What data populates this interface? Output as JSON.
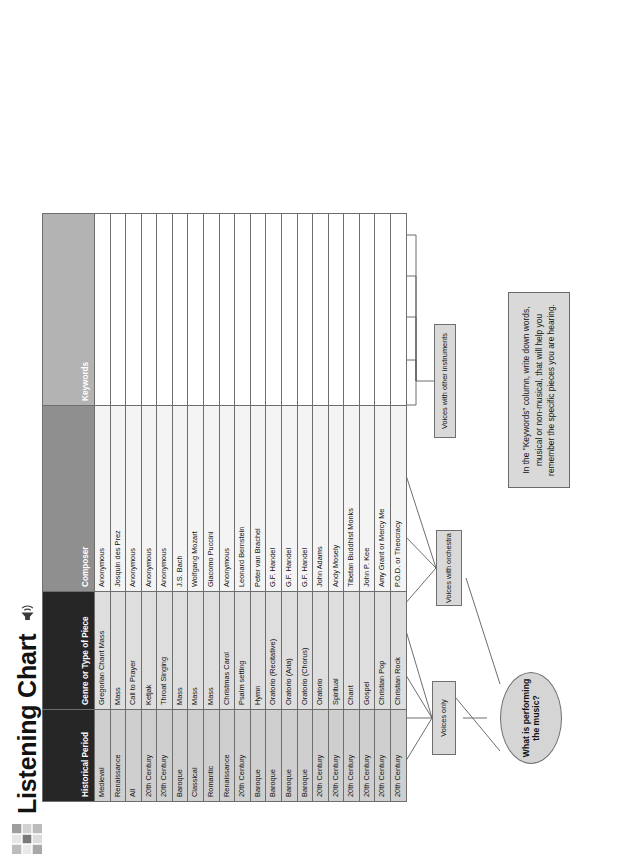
{
  "header": {
    "title": "Listening Chart",
    "grid_icon": "grid-table-icon",
    "speaker_icon": "speaker-sound-icon"
  },
  "root": {
    "label": "What is performing the music?"
  },
  "note": {
    "text": "In the \"Keywords\" column, write down words, musical or non-musical, that will help you remember the specific pieces you are hearing."
  },
  "branches": [
    {
      "id": "voices-only",
      "label": "Voices only"
    },
    {
      "id": "voices-orchestra",
      "label": "Voices with orchestra"
    },
    {
      "id": "voices-instruments",
      "label": "Voices with other instruments"
    }
  ],
  "level2": [
    {
      "id": "latin-greek",
      "label": "Latin/Greek"
    },
    {
      "id": "arabic",
      "label": "Arabic"
    },
    {
      "id": "balinese",
      "label": "Balinese"
    },
    {
      "id": "tuvan",
      "label": "Tuvan vocalization"
    },
    {
      "id": "latin",
      "label": "Latin"
    },
    {
      "id": "hebrew",
      "label": "Hebrew"
    },
    {
      "id": "english",
      "label": "English"
    },
    {
      "id": "voice-guitar",
      "label": "Voice and guitar"
    },
    {
      "id": "gongs-horns",
      "label": "Gongs, low horns"
    },
    {
      "id": "gospel-band",
      "label": "Gospel Band"
    },
    {
      "id": "pop-band",
      "label": "Pop Band"
    },
    {
      "id": "rock-band",
      "label": "Rock Band"
    }
  ],
  "level3": [
    {
      "id": "monophonic-1",
      "label": "Monophonic"
    },
    {
      "id": "polyphonic-1",
      "label": "Polyphonic"
    },
    {
      "id": "monophonic-2",
      "label": "Monophonic"
    },
    {
      "id": "polyrhythmic",
      "label": "Polyrhythmic"
    },
    {
      "id": "multiphonics",
      "label": "Multiphonics"
    },
    {
      "id": "imitative",
      "label": "Imitative"
    },
    {
      "id": "strong-then-imitative",
      "label": "Strong then imitative"
    },
    {
      "id": "lyrical-melody",
      "label": "Lyrical melody"
    },
    {
      "id": "percussive-sounds",
      "label": "Percussive sounds"
    },
    {
      "id": "low-vocal",
      "label": "Low vocal"
    },
    {
      "id": "additional-unison-voices",
      "label": "Additional unison voices"
    },
    {
      "id": "additional-strings",
      "label": "Additional strings"
    },
    {
      "id": "heavy-metal-sound",
      "label": "Heavy metal sound"
    }
  ],
  "level4": [
    {
      "id": "kyrie",
      "label": "Kyrie"
    },
    {
      "id": "gloria",
      "label": "Gloria"
    },
    {
      "id": "allahu-akbar",
      "label": "Allahu Akbar"
    },
    {
      "id": "chanting",
      "label": "Chanting"
    },
    {
      "id": "low-tone",
      "label": "Low tone plus melody"
    },
    {
      "id": "credo",
      "label": "Credo"
    },
    {
      "id": "sanctus",
      "label": "Sanctus"
    },
    {
      "id": "agnus-dei",
      "label": "Agnus Dei"
    },
    {
      "id": "christmas",
      "label": "Christmas"
    },
    {
      "id": "adonai",
      "label": "Adonai, or Lamah rag'shu"
    },
    {
      "id": "strophic",
      "label": "Strophic"
    },
    {
      "id": "indistinct-rhythm",
      "label": "Indistinct rhythm"
    },
    {
      "id": "trumpet-solo",
      "label": "Trumpet with solo voice"
    },
    {
      "id": "chorus",
      "label": "Chorus"
    },
    {
      "id": "strong-rhythm",
      "label": "Strong rhythm"
    }
  ],
  "table": {
    "columns": [
      {
        "key": "period",
        "label": "Historical Period"
      },
      {
        "key": "genre",
        "label": "Genre or Type of Piece"
      },
      {
        "key": "composer",
        "label": "Composer"
      },
      {
        "key": "keywords",
        "label": "Keywords"
      }
    ],
    "rows": [
      {
        "period": "Medieval",
        "genre": "Gregorian Chant Mass",
        "composer": "Anonymous",
        "keywords": ""
      },
      {
        "period": "Renaissance",
        "genre": "Mass",
        "composer": "Josquin des Prez",
        "keywords": ""
      },
      {
        "period": "All",
        "genre": "Call to Prayer",
        "composer": "Anonymous",
        "keywords": ""
      },
      {
        "period": "20th Century",
        "genre": "Ketjak",
        "composer": "Anonymous",
        "keywords": ""
      },
      {
        "period": "20th Century",
        "genre": "Throat Singing",
        "composer": "Anonymous",
        "keywords": ""
      },
      {
        "period": "Baroque",
        "genre": "Mass",
        "composer": "J.S. Bach",
        "keywords": ""
      },
      {
        "period": "Classical",
        "genre": "Mass",
        "composer": "Wolfgang Mozart",
        "keywords": ""
      },
      {
        "period": "Romantic",
        "genre": "Mass",
        "composer": "Giacomo Puccini",
        "keywords": ""
      },
      {
        "period": "Renaissance",
        "genre": "Christmas Carol",
        "composer": "Anonymous",
        "keywords": ""
      },
      {
        "period": "20th Century",
        "genre": "Psalm setting",
        "composer": "Leonard Bernstein",
        "keywords": ""
      },
      {
        "period": "Baroque",
        "genre": "Hymn",
        "composer": "Peter van Brachel",
        "keywords": ""
      },
      {
        "period": "Baroque",
        "genre": "Oratorio (Recitative)",
        "composer": "G.F. Handel",
        "keywords": ""
      },
      {
        "period": "Baroque",
        "genre": "Oratorio (Aria)",
        "composer": "G.F. Handel",
        "keywords": ""
      },
      {
        "period": "Baroque",
        "genre": "Oratorio (Chorus)",
        "composer": "G.F. Handel",
        "keywords": ""
      },
      {
        "period": "20th Century",
        "genre": "Oratorio",
        "composer": "John Adams",
        "keywords": ""
      },
      {
        "period": "20th Century",
        "genre": "Spiritual",
        "composer": "Andy Mosely",
        "keywords": ""
      },
      {
        "period": "20th Century",
        "genre": "Chant",
        "composer": "Tibetan Buddhist Monks",
        "keywords": ""
      },
      {
        "period": "20th Century",
        "genre": "Gospel",
        "composer": "John P. Kee",
        "keywords": ""
      },
      {
        "period": "20th Century",
        "genre": "Christian Pop",
        "composer": "Amy Grant or Mercy Me",
        "keywords": ""
      },
      {
        "period": "20th Century",
        "genre": "Christian Rock",
        "composer": "P.O.D. or Theocracy",
        "keywords": ""
      }
    ]
  },
  "colors": {
    "node_fill": "#d9d9d9",
    "header_dark": "#262626",
    "header_mid": "#8f8f8f",
    "header_light": "#b3b3b3",
    "border": "#6e6e6e"
  }
}
